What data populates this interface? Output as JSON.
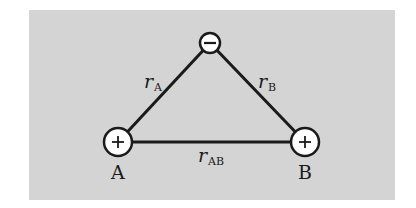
{
  "diagram": {
    "type": "charge triangle",
    "colors": {
      "background": "#d4d4d4",
      "line": "#1a1a1a",
      "ion_fill": "#ffffff"
    },
    "ions": [
      {
        "id": "top",
        "charge_symbol": "−",
        "sign": "negative"
      },
      {
        "id": "A",
        "charge_symbol": "+",
        "sign": "positive",
        "label": "A"
      },
      {
        "id": "B",
        "charge_symbol": "+",
        "sign": "positive",
        "label": "B"
      }
    ],
    "distances": [
      {
        "var": "r",
        "sub": "A"
      },
      {
        "var": "r",
        "sub": "B"
      },
      {
        "var": "r",
        "sub": "AB"
      }
    ]
  }
}
